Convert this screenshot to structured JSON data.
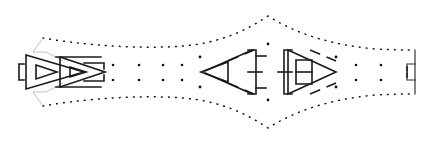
{
  "figure": {
    "title": "Symmetric schematic line diagram",
    "width": 439,
    "height": 143,
    "background_color": "#ffffff",
    "stroke_color": "#1a1a1a",
    "hairline_color": "#9a9a9a",
    "dot_color": "#111111",
    "center_y": 72,
    "center_x": 268
  },
  "chart_data": {
    "type": "line",
    "title": "Symmetric schematic line diagram",
    "xlabel": "",
    "ylabel": "",
    "xlim": [
      0,
      439
    ],
    "ylim": [
      0,
      143
    ],
    "grid": false,
    "legend": "none",
    "series": [
      {
        "name": "upper-envelope",
        "style": "dotted",
        "x": [
          43,
          70,
          100,
          130,
          160,
          190,
          215,
          240,
          268,
          295,
          320,
          348,
          375,
          400,
          415
        ],
        "y": [
          38,
          42,
          45,
          47,
          47,
          45,
          41,
          33,
          16,
          32,
          41,
          46,
          49,
          50,
          50
        ]
      },
      {
        "name": "lower-envelope",
        "style": "dotted",
        "x": [
          43,
          70,
          100,
          130,
          160,
          190,
          215,
          240,
          268,
          295,
          320,
          348,
          375,
          400,
          415
        ],
        "y": [
          106,
          102,
          99,
          97,
          97,
          99,
          103,
          111,
          128,
          112,
          103,
          98,
          95,
          94,
          94
        ]
      }
    ],
    "annotations": [
      {
        "label": "axis-dot-upper",
        "x": 268,
        "y": 44
      },
      {
        "label": "axis-dot-lower",
        "x": 268,
        "y": 100
      }
    ]
  },
  "envelope": {
    "name": "dotted-envelope-contour",
    "upper_path": "M 43,38 C 78,44 120,48 165,47 C 205,46 235,38 268,16 C 300,36 335,45 375,49 C 392,50 405,50 415,50",
    "lower_path": "M 43,106 C 78,100 120,96 165,97 C 205,98 235,106 268,128 C 300,108 335,99 375,95 C 392,94 405,94 415,94",
    "left_cap_upper": "M 43,38 L 33,52",
    "left_cap_lower": "M 43,106 L 33,92",
    "right_cap": "M 415,50 L 415,94"
  },
  "left_cluster": {
    "name": "left-nested-arrow-group",
    "description": "Nested triangular arrow heads with bracket terminals",
    "outer_triangle": "M 26,55 L 84,72 L 26,89 Z",
    "inner_triangle_a": "M 36,65 L 57,72 L 36,79 Z",
    "outer_triangle_b": "M 60,57 L 105,72 L 60,87 Z",
    "inner_triangle_b": "M 70,67 L 86,72 L 70,77 Z",
    "left_bracket": "M 24,64 L 19,64 L 19,80 L 24,80",
    "top_rail": "M 56,57 L 101,57",
    "bottom_rail": "M 56,87 L 101,87",
    "tail_upper": "M 84,63 L 104,63 L 104,69",
    "tail_lower": "M 84,81 L 104,81 L 104,75",
    "hairline_upper": "M 33,52 L 46,52",
    "hairline_lower": "M 33,92 L 46,92",
    "hairline_diag_upper": "M 46,52 L 63,61",
    "hairline_diag_lower": "M 46,92 L 63,83"
  },
  "center_left_cluster": {
    "name": "center-left-funnel-group",
    "small_triangle": "M 201,72 L 228,62 L 228,82 Z",
    "funnel_upper": "M 205,71 L 252,50 L 252,50",
    "funnel_lower": "M 205,73 L 252,94",
    "dashed_upper": "M 228,61 L 254,50",
    "dashed_lower": "M 228,83 L 254,94",
    "right_bracket_outer": "M 248,50 L 256,50 L 256,94 L 248,94",
    "right_bracket_mid": "M 248,72 L 262,72",
    "right_bracket_top": "M 256,56 L 266,56",
    "right_bracket_bottom": "M 256,88 L 266,88"
  },
  "center_right_cluster": {
    "name": "center-right-funnel-group",
    "big_triangle": "M 336,72 L 288,50 L 288,94 Z",
    "dashed_upper": "M 310,50 L 336,61",
    "dashed_lower": "M 310,94 L 336,83",
    "left_bracket_outer": "M 292,50 L 284,50 L 284,94 L 292,94",
    "left_bracket_mid": "M 292,72 L 278,72",
    "inner_box": "M 296,60 L 312,60 L 312,84 L 296,84 Z",
    "inner_bar": "M 296,72 L 312,72"
  },
  "right_terminal": {
    "name": "right-bracket-terminal",
    "bracket_upper": "M 415,64 L 407,64 L 407,70",
    "bracket_lower": "M 415,80 L 407,80 L 407,74",
    "stem": "M 407,67 L 407,77"
  },
  "dot_field": {
    "name": "interior-dot-field",
    "upper_row_y": 65,
    "lower_row_y": 80,
    "left_group_x": [
      113,
      139,
      163,
      182
    ],
    "right_group_x": [
      356,
      381
    ],
    "dot_radius": 1.3
  },
  "axis_dots": {
    "name": "center-axis-dots",
    "points": [
      {
        "x": 268,
        "y": 44
      },
      {
        "x": 268,
        "y": 100
      },
      {
        "x": 200,
        "y": 57
      },
      {
        "x": 200,
        "y": 87
      },
      {
        "x": 336,
        "y": 57
      },
      {
        "x": 336,
        "y": 87
      }
    ],
    "radius": 1.4
  }
}
